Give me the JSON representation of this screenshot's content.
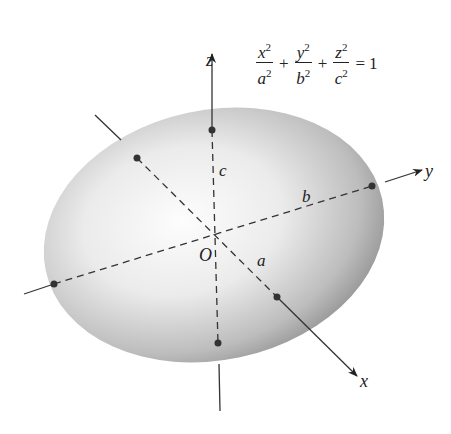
{
  "figure": {
    "axes": {
      "x_label": "x",
      "y_label": "y",
      "z_label": "z",
      "origin_label": "O"
    },
    "semi_axes": {
      "a_label": "a",
      "b_label": "b",
      "c_label": "c"
    },
    "equation": {
      "terms": [
        {
          "num": "x",
          "den": "a",
          "exp": "2"
        },
        {
          "num": "y",
          "den": "b",
          "exp": "2"
        },
        {
          "num": "z",
          "den": "c",
          "exp": "2"
        }
      ],
      "plus": "+",
      "equals": "=",
      "rhs": "1"
    },
    "colors": {
      "surface_light": "#fafafa",
      "surface_dark": "#9a9a9a",
      "axis": "#333333"
    }
  }
}
